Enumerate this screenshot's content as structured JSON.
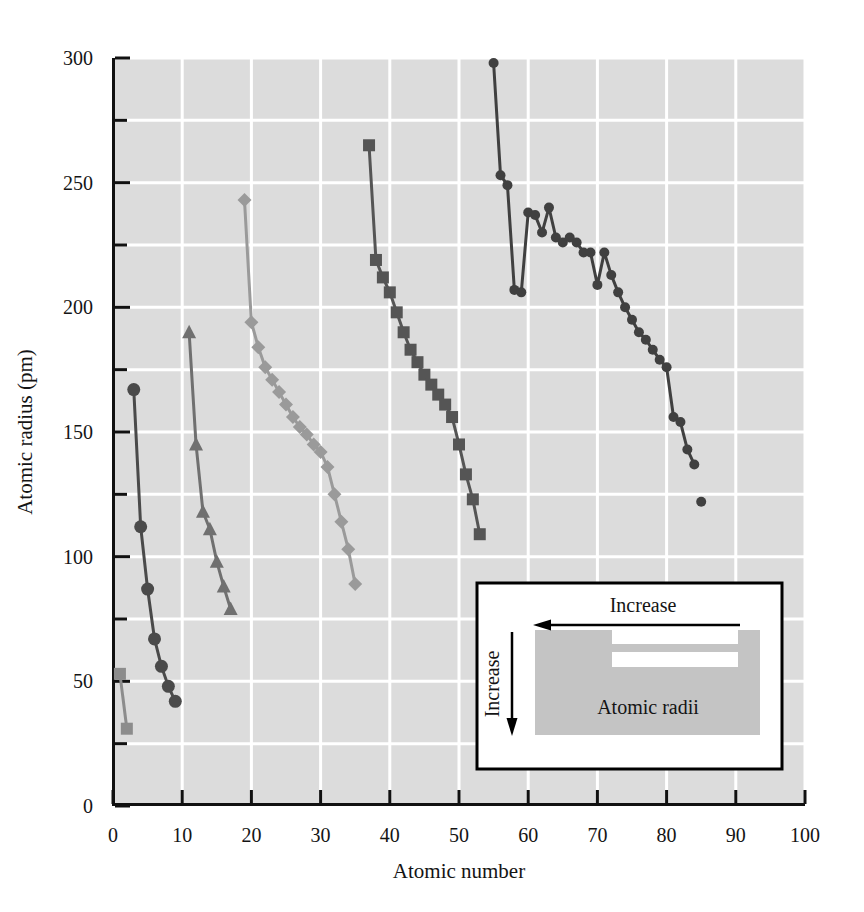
{
  "chart_data": {
    "type": "line",
    "title": "",
    "xlabel": "Atomic number",
    "ylabel": "Atomic radius (pm)",
    "xlim": [
      0,
      100
    ],
    "ylim": [
      0,
      300
    ],
    "xticks": [
      0,
      10,
      20,
      30,
      40,
      50,
      60,
      70,
      80,
      90,
      100
    ],
    "yticks": [
      0,
      50,
      100,
      150,
      200,
      250,
      300
    ],
    "y_minor_ticks": [
      25,
      75,
      125,
      175,
      225,
      275
    ],
    "grid": true,
    "grid_color": "#ffffff",
    "plot_background": "#dcdcdc",
    "legend": "none",
    "series": [
      {
        "name": "period-1",
        "marker": "square",
        "color": "#8c8c8c",
        "x": [
          1,
          2
        ],
        "y": [
          53,
          31
        ]
      },
      {
        "name": "period-2",
        "marker": "circle",
        "color": "#4a4a4a",
        "x": [
          3,
          4,
          5,
          6,
          7,
          8,
          9
        ],
        "y": [
          167,
          112,
          87,
          67,
          56,
          48,
          42
        ]
      },
      {
        "name": "period-3",
        "marker": "triangle",
        "color": "#707070",
        "x": [
          11,
          12,
          13,
          14,
          15,
          16,
          17
        ],
        "y": [
          190,
          145,
          118,
          111,
          98,
          88,
          79
        ]
      },
      {
        "name": "period-4",
        "marker": "diamond",
        "color": "#9a9a9a",
        "x": [
          19,
          20,
          21,
          22,
          23,
          24,
          25,
          26,
          27,
          28,
          29,
          30,
          31,
          32,
          33,
          34,
          35
        ],
        "y": [
          243,
          194,
          184,
          176,
          171,
          166,
          161,
          156,
          152,
          149,
          145,
          142,
          136,
          125,
          114,
          103,
          89
        ]
      },
      {
        "name": "period-5",
        "marker": "square",
        "color": "#555555",
        "x": [
          37,
          38,
          39,
          40,
          41,
          42,
          43,
          44,
          45,
          46,
          47,
          48,
          49,
          50,
          51,
          52,
          53
        ],
        "y": [
          265,
          219,
          212,
          206,
          198,
          190,
          183,
          178,
          173,
          169,
          165,
          161,
          156,
          145,
          133,
          123,
          109
        ]
      },
      {
        "name": "period-6",
        "marker": "circle-small",
        "color": "#404040",
        "x": [
          55,
          56,
          57,
          58,
          59,
          60,
          61,
          62,
          63,
          64,
          65,
          66,
          67,
          68,
          69,
          70,
          71,
          72,
          73,
          74,
          75,
          76,
          77,
          78,
          79,
          80,
          81,
          82,
          83,
          84
        ],
        "y": [
          298,
          253,
          249,
          207,
          206,
          238,
          237,
          230,
          240,
          228,
          226,
          228,
          226,
          222,
          222,
          209,
          222,
          213,
          206,
          200,
          195,
          190,
          187,
          183,
          179,
          176,
          156,
          154,
          143,
          137
        ]
      },
      {
        "name": "astatine-isolated",
        "marker": "circle-small",
        "color": "#404040",
        "connected": false,
        "x": [
          85
        ],
        "y": [
          122
        ]
      }
    ]
  },
  "axes": {
    "x": {
      "label": "Atomic number",
      "tick_labels": [
        "0",
        "10",
        "20",
        "30",
        "40",
        "50",
        "60",
        "70",
        "80",
        "90",
        "100"
      ]
    },
    "y": {
      "label": "Atomic radius (pm)",
      "tick_labels": [
        "0",
        "50",
        "100",
        "150",
        "200",
        "250",
        "300"
      ]
    }
  },
  "inset": {
    "horizontal_arrow_label": "Increase",
    "vertical_arrow_label": "Increase",
    "body_label": "Atomic radii",
    "border_color": "#000000",
    "fill_color": "#ffffff",
    "table_color": "#c4c4c4"
  }
}
